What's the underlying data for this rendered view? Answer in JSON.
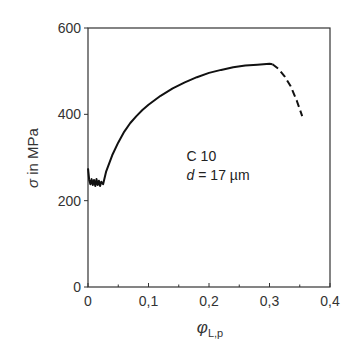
{
  "chart_data": {
    "type": "line",
    "title": "",
    "xlabel": "φ_L,p",
    "xlabel_main": "φ",
    "xlabel_sub": "L,p",
    "ylabel": "σ in MPa",
    "xlim": [
      0,
      0.4
    ],
    "ylim": [
      0,
      600
    ],
    "xticks": [
      0,
      0.1,
      0.2,
      0.3,
      0.4
    ],
    "xtick_labels": [
      "0",
      "0,1",
      "0,2",
      "0,3",
      "0,4"
    ],
    "yticks": [
      0,
      200,
      400,
      600
    ],
    "ytick_labels": [
      "0",
      "200",
      "400",
      "600"
    ],
    "grid": false,
    "legend": null,
    "annotations": [
      {
        "text": "C 10",
        "x": 0.163,
        "y": 292
      },
      {
        "text": "d = 17 µm",
        "x": 0.163,
        "y": 248
      }
    ],
    "series": [
      {
        "name": "measured (solid)",
        "style": "solid",
        "x": [
          0,
          0.002,
          0.004,
          0.006,
          0.008,
          0.01,
          0.012,
          0.014,
          0.016,
          0.018,
          0.02,
          0.022,
          0.025,
          0.03,
          0.04,
          0.05,
          0.06,
          0.07,
          0.08,
          0.09,
          0.1,
          0.12,
          0.14,
          0.16,
          0.18,
          0.2,
          0.22,
          0.24,
          0.26,
          0.28,
          0.3,
          0.305
        ],
        "y": [
          275,
          248,
          238,
          250,
          236,
          248,
          234,
          250,
          236,
          246,
          234,
          244,
          238,
          268,
          305,
          335,
          360,
          380,
          396,
          410,
          422,
          443,
          460,
          474,
          486,
          496,
          503,
          509,
          513,
          515,
          517,
          516
        ]
      },
      {
        "name": "extrapolated (dashed)",
        "style": "dashed",
        "x": [
          0.305,
          0.315,
          0.325,
          0.335,
          0.345,
          0.354
        ],
        "y": [
          516,
          505,
          488,
          465,
          432,
          396
        ]
      }
    ]
  }
}
